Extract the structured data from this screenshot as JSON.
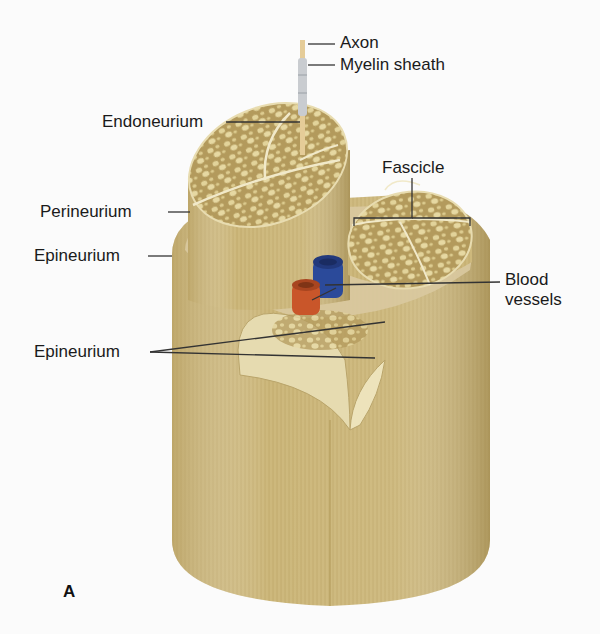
{
  "figure": {
    "panel_label": "A",
    "labels": {
      "axon": "Axon",
      "myelin_sheath": "Myelin sheath",
      "endoneurium": "Endoneurium",
      "fascicle": "Fascicle",
      "perineurium": "Perineurium",
      "epineurium_outer": "Epineurium",
      "blood_vessels_line1": "Blood",
      "blood_vessels_line2": "vessels",
      "epineurium_inner": "Epineurium"
    },
    "colors": {
      "nerve_tan": "#c9b377",
      "nerve_light": "#dccb92",
      "nerve_dark": "#a88f52",
      "fascicle_fill": "#b39a5c",
      "fiber_dots": "#e2d39a",
      "vein_blue": "#2b4a9a",
      "artery_red": "#c9562a",
      "leader_line": "#333333",
      "background": "#fbfbfb"
    }
  }
}
